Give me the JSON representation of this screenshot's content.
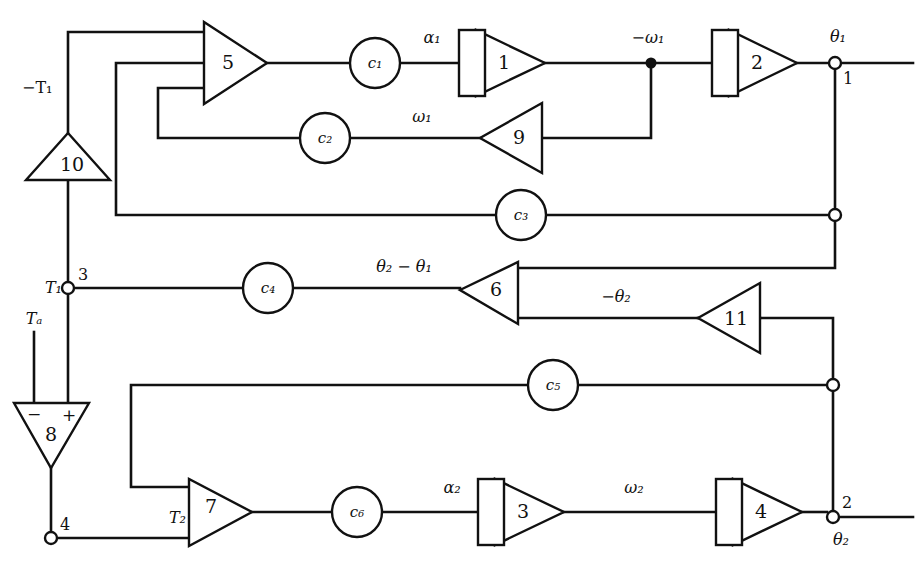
{
  "diagram": {
    "background_color": "#ffffff",
    "line_color": "#111111",
    "width": 915,
    "height": 569,
    "integrators": [
      {
        "id": "int-1",
        "label": "1",
        "input_signal": "α₁",
        "output_signal": "−ω₁"
      },
      {
        "id": "int-2",
        "label": "2",
        "input_signal": "−ω₁",
        "output_signal": "θ₁"
      },
      {
        "id": "int-3",
        "label": "3",
        "input_signal": "α₂",
        "output_signal": "ω₂"
      },
      {
        "id": "int-4",
        "label": "4",
        "input_signal": "ω₂",
        "output_signal": "θ₂"
      }
    ],
    "amplifiers": [
      {
        "id": "amp-5",
        "label": "5",
        "direction": "right",
        "inputs": 3
      },
      {
        "id": "amp-6",
        "label": "6",
        "direction": "left",
        "inputs": 2
      },
      {
        "id": "amp-7",
        "label": "7",
        "direction": "right",
        "inputs": 2,
        "input_label": "T₂"
      },
      {
        "id": "amp-8",
        "label": "8",
        "direction": "down",
        "inputs": 2,
        "signs": [
          "−",
          "+"
        ]
      },
      {
        "id": "amp-9",
        "label": "9",
        "direction": "left",
        "inputs": 1
      },
      {
        "id": "amp-10",
        "label": "10",
        "direction": "up",
        "inputs": 1
      },
      {
        "id": "amp-11",
        "label": "11",
        "direction": "left",
        "inputs": 1
      }
    ],
    "coefficients": [
      {
        "id": "pot-c1",
        "label": "c₁"
      },
      {
        "id": "pot-c2",
        "label": "c₂"
      },
      {
        "id": "pot-c3",
        "label": "c₃"
      },
      {
        "id": "pot-c4",
        "label": "c₄"
      },
      {
        "id": "pot-c5",
        "label": "c₅"
      },
      {
        "id": "pot-c6",
        "label": "c₆"
      }
    ],
    "signal_labels": {
      "neg_T1": "−T₁",
      "T1": "T₁",
      "Ta": "Tₐ",
      "T2": "T₂",
      "alpha1": "α₁",
      "alpha2": "α₂",
      "omega1": "ω₁",
      "neg_omega1": "−ω₁",
      "omega2": "ω₂",
      "theta1": "θ₁",
      "theta2": "θ₂",
      "neg_theta2": "−θ₂",
      "theta_diff": "θ₂ − θ₁"
    },
    "terminals": [
      {
        "id": "terminal-1",
        "label": "1",
        "signal": "θ₁"
      },
      {
        "id": "terminal-2",
        "label": "2",
        "signal": "θ₂"
      },
      {
        "id": "terminal-3",
        "label": "3",
        "signal": "T₁"
      },
      {
        "id": "terminal-4",
        "label": "4",
        "signal": ""
      }
    ],
    "signs": {
      "minus": "−",
      "plus": "+"
    }
  }
}
